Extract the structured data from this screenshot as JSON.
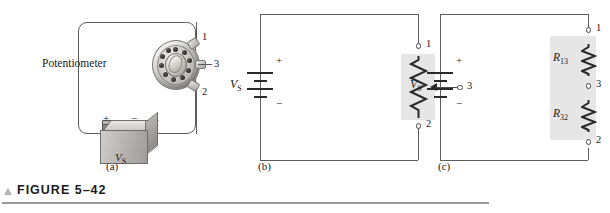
{
  "figure": {
    "caption": "FIGURE 5–42",
    "marker_icon": "triangle-up-icon"
  },
  "panels": [
    {
      "id": "a",
      "label": "(a)",
      "type": "pictorial",
      "component_label": "Potentiometer",
      "source_label": "VS",
      "source_label_main": "V",
      "source_label_sub": "S",
      "polarity_plus": "+",
      "polarity_minus": "−",
      "terminals": [
        "1",
        "3",
        "2"
      ]
    },
    {
      "id": "b",
      "label": "(b)",
      "type": "schematic-potentiometer",
      "source_label_main": "V",
      "source_label_sub": "S",
      "polarity_plus": "+",
      "polarity_minus": "−",
      "terminals": [
        "1",
        "2",
        "3"
      ],
      "wiper_terminal": "3"
    },
    {
      "id": "c",
      "label": "(c)",
      "type": "schematic-two-resistors",
      "source_label_main": "V",
      "source_label_sub": "S",
      "polarity_plus": "+",
      "polarity_minus": "−",
      "terminals": [
        "1",
        "3",
        "2"
      ],
      "resistors": [
        {
          "main": "R",
          "sub": "13"
        },
        {
          "main": "R",
          "sub": "32"
        }
      ]
    }
  ],
  "colors": {
    "wire": "#5d5d5d",
    "symbol": "#2b2a29",
    "shade_box": "#e6e6e6",
    "rule": "#9a9a9a",
    "marker": "#b4b4b4",
    "text": "#1a1a1a"
  }
}
